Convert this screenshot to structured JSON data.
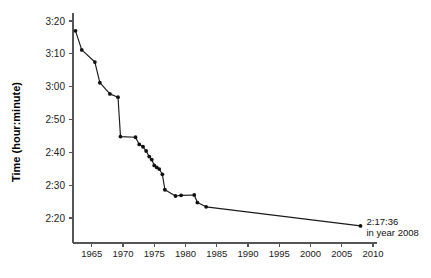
{
  "chart_data": {
    "type": "line",
    "title": "",
    "xlabel": "",
    "ylabel": "Time (hour:minute)",
    "xlim": [
      1962,
      2010
    ],
    "ylim": [
      135,
      200
    ],
    "grid": false,
    "legend": null,
    "x_ticks": [
      1965,
      1970,
      1975,
      1980,
      1985,
      1990,
      1995,
      2000,
      2005,
      2010
    ],
    "x_tick_labels": [
      "1965",
      "1970",
      "1975",
      "1980",
      "1985",
      "1990",
      "1995",
      "2000",
      "2005",
      "2010"
    ],
    "y_ticks": [
      200,
      190,
      180,
      170,
      160,
      150,
      140
    ],
    "y_tick_labels": [
      "3:20",
      "3:10",
      "3:00",
      "2:50",
      "2:40",
      "2:30",
      "2:20"
    ],
    "y_unit": "minutes",
    "series": [
      {
        "name": "record-progression",
        "x": [
          1962.4,
          1963.4,
          1965.5,
          1966.3,
          1967.9,
          1969.2,
          1969.6,
          1972.0,
          1972.6,
          1973.2,
          1973.7,
          1974.2,
          1974.6,
          1975.0,
          1975.4,
          1975.8,
          1976.3,
          1976.7,
          1978.4,
          1979.3,
          1981.4,
          1981.9,
          1983.3,
          2008.0
        ],
        "y": [
          197.0,
          191.2,
          187.5,
          181.2,
          177.8,
          176.8,
          164.8,
          164.6,
          162.4,
          161.7,
          160.4,
          158.7,
          157.8,
          156.0,
          155.4,
          154.9,
          153.3,
          148.6,
          146.7,
          146.9,
          147.0,
          144.7,
          143.4,
          137.6
        ],
        "y_labels": [
          "3:17",
          "3:11",
          "3:07:30",
          "3:01:12",
          "2:57:48",
          "2:56:48",
          "2:44:48",
          "2:44:36",
          "2:42:24",
          "2:41:42",
          "2:40:24",
          "2:38:42",
          "2:37:48",
          "2:36:00",
          "2:35:24",
          "2:34:54",
          "2:33:18",
          "2:28:36",
          "2:26:42",
          "2:26:54",
          "2:27:00",
          "2:24:42",
          "2:23:24",
          "2:17:36"
        ]
      }
    ],
    "annotations": [
      {
        "name": "final-record",
        "line1": "2:17:36",
        "line2": "in year 2008",
        "x": 2008.0,
        "y": 137.6
      }
    ],
    "colors": {
      "line": "#1a1a1a",
      "marker": "#111111",
      "axis": "#555555",
      "text": "#222222",
      "background": "#ffffff"
    }
  }
}
